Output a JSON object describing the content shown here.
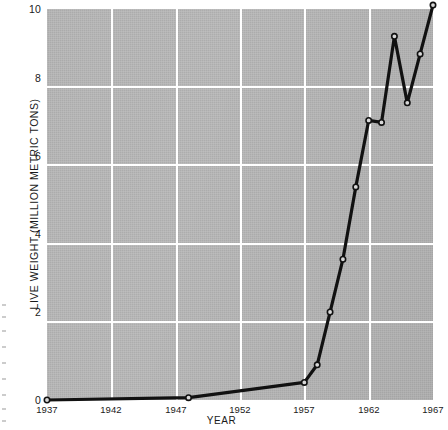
{
  "chart_data": {
    "type": "line",
    "title": "",
    "xlabel": "YEAR",
    "ylabel": "LIVE WEIGHT (MILLION METRIC TONS)",
    "xlim": [
      1937,
      1967
    ],
    "ylim": [
      0,
      10
    ],
    "grid": true,
    "legend_position": "none",
    "x_tick_labels": [
      "1937",
      "1942",
      "1947",
      "1952",
      "1957",
      "1962",
      "1967"
    ],
    "x_ticks": [
      1937,
      1942,
      1947,
      1952,
      1957,
      1962,
      1967
    ],
    "y_tick_labels": [
      "0",
      "2",
      "4",
      "6",
      "8",
      "10"
    ],
    "y_ticks": [
      0,
      2,
      4,
      6,
      8,
      10
    ],
    "series": [
      {
        "name": "Live weight",
        "marker": "open-circle",
        "color": "#111111",
        "x": [
          1937,
          1948,
          1957,
          1958,
          1959,
          1960,
          1961,
          1962,
          1963,
          1964,
          1965,
          1966,
          1967
        ],
        "values": [
          0.0,
          0.06,
          0.45,
          0.9,
          2.25,
          3.6,
          5.45,
          7.15,
          7.1,
          9.3,
          7.6,
          8.85,
          10.1
        ]
      }
    ]
  },
  "axes": {
    "y_label": "LIVE WEIGHT (MILLION METRIC TONS)",
    "x_label": "YEAR"
  },
  "colors": {
    "plot_background": "#b9b9b9",
    "gridline": "#ffffff",
    "line": "#111111",
    "marker_fill": "#d8d8d8",
    "text": "#1a1a1a",
    "page_background": "#ffffff"
  }
}
